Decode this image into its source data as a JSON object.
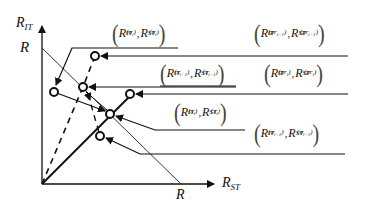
{
  "diagram": {
    "axes": {
      "y_label": {
        "base": "R",
        "sub": "IT"
      },
      "x_label": {
        "base": "R",
        "sub": "ST"
      },
      "y_intercept_label": "R",
      "x_intercept_label": "R"
    },
    "annotations": [
      {
        "id": "o_i",
        "sup": "(o_i)",
        "text_it": "R_IT^(o_i)",
        "text_st": "R_ST^(o_i)"
      },
      {
        "id": "pr_i_plus_1",
        "sup": "(pr_{i+1})",
        "text_it": "R_IT^(pr_{i+1})",
        "text_st": "R_ST^(pr_{i+1})"
      },
      {
        "id": "x_i_plus_1",
        "sup": "(x_{i+1})",
        "text_it": "R_IT^(x_{i+1})",
        "text_st": "R_ST^(x_{i+1})"
      },
      {
        "id": "pr_i",
        "sup": "(pr_i)",
        "text_it": "R_IT^(pr_i)",
        "text_st": "R_ST^(pr_i)"
      },
      {
        "id": "x_i",
        "sup": "(x_i)",
        "text_it": "R_IT^(x_i)",
        "text_st": "R_ST^(x_i)"
      },
      {
        "id": "o_i_plus_1",
        "sup": "(o_{i+1})",
        "text_it": "R_IT^(o_{i+1})",
        "text_st": "R_ST^(o_{i+1})"
      }
    ],
    "labels": {
      "R": "R",
      "IT": "IT",
      "ST": "ST",
      "comma": ",",
      "lp": "(",
      "rp": ")",
      "s_oi": "(o",
      "s_oi_sub": "i",
      "s_close": ")",
      "s_pri1": "(pr",
      "s_pri1_sub": "i+1",
      "s_xi1": "(x",
      "s_xi1_sub": "i+1",
      "s_pri": "(pr",
      "s_pri_sub": "i",
      "s_xi": "(x",
      "s_xi_sub": "i",
      "s_oi1": "(o",
      "s_oi1_sub": "i+1"
    }
  }
}
